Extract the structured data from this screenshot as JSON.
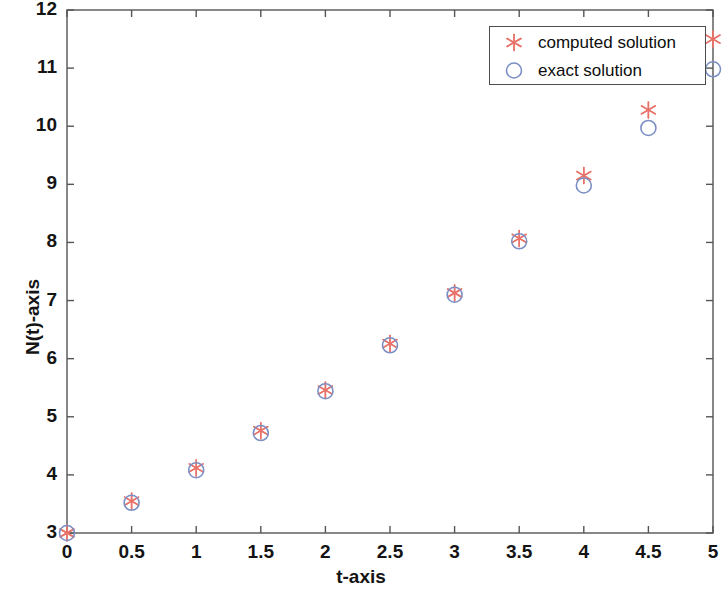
{
  "chart_data": {
    "type": "scatter",
    "title": "",
    "xlabel": "t-axis",
    "ylabel": "N(t)-axis",
    "xlim": [
      0,
      5
    ],
    "ylim": [
      3,
      12
    ],
    "xticks": [
      "0",
      "0.5",
      "1",
      "1.5",
      "2",
      "2.5",
      "3",
      "3.5",
      "4",
      "4.5",
      "5"
    ],
    "xtick_values": [
      0,
      0.5,
      1,
      1.5,
      2,
      2.5,
      3,
      3.5,
      4,
      4.5,
      5
    ],
    "yticks": [
      "3",
      "4",
      "5",
      "6",
      "7",
      "8",
      "9",
      "10",
      "11",
      "12"
    ],
    "ytick_values": [
      3,
      4,
      5,
      6,
      7,
      8,
      9,
      10,
      11,
      12
    ],
    "grid": false,
    "legend_position": "upper right",
    "x": [
      0,
      0.5,
      1,
      1.5,
      2,
      2.5,
      3,
      3.5,
      4,
      4.5,
      5
    ],
    "series": [
      {
        "name": "computed solution",
        "marker": "star",
        "color": "#e8736a",
        "values": [
          3.0,
          3.55,
          4.12,
          4.76,
          5.46,
          6.26,
          7.13,
          8.07,
          9.15,
          10.28,
          11.5
        ]
      },
      {
        "name": "exact solution",
        "marker": "circle",
        "color": "#7b8fc4",
        "values": [
          3.0,
          3.52,
          4.08,
          4.72,
          5.44,
          6.23,
          7.1,
          8.02,
          8.98,
          9.97,
          10.98
        ]
      }
    ],
    "axis_color": "#555555",
    "background": "#ffffff"
  }
}
